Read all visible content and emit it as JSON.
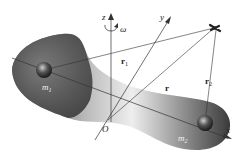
{
  "diagram": {
    "body": {
      "label": "rigid-body",
      "color_dark": "#3a3a3a",
      "color_light": "#e8e8e8"
    },
    "masses": [
      {
        "id": "m1",
        "label": "m",
        "subscript": "1",
        "x": 44,
        "y": 70
      },
      {
        "id": "m2",
        "label": "m",
        "subscript": "2",
        "x": 205,
        "y": 123
      }
    ],
    "origin": {
      "label": "O",
      "x": 108,
      "y": 120
    },
    "axes": {
      "x": {
        "label": "x"
      },
      "y": {
        "label": "y"
      },
      "z": {
        "label": "z"
      }
    },
    "angular_velocity": {
      "label": "ω"
    },
    "vectors": {
      "r": {
        "label": "r"
      },
      "r1": {
        "label": "r",
        "subscript": "1"
      },
      "r2": {
        "label": "r",
        "subscript": "2"
      }
    },
    "target": {
      "label": "satellite",
      "x": 215,
      "y": 28
    }
  }
}
